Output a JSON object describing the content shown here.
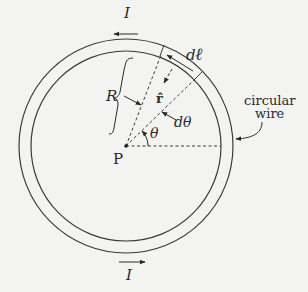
{
  "diagram": {
    "labels": {
      "current_top": "I",
      "current_bottom": "I",
      "line_element_d": "d",
      "line_element_l": "ℓ",
      "radius": "R",
      "unit_vector": "r̂",
      "d_theta": "dθ",
      "theta": "θ",
      "point": "P",
      "wire_line1": "circular",
      "wire_line2": "wire"
    },
    "geometry": {
      "center": [
        126,
        146
      ],
      "inner_radius": 95,
      "outer_radius": 107,
      "theta_deg": 46,
      "d_theta_deg": 23
    },
    "colors": {
      "background": "#f3f3f1",
      "stroke": "#3a3a3a",
      "text": "#2a2a2a"
    }
  }
}
